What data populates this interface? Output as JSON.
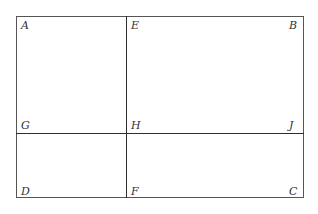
{
  "diagram": {
    "title": "",
    "type": "rectangle-partition",
    "stroke_color": "#3a3a3a",
    "labels": {
      "A": "A",
      "B": "B",
      "C": "C",
      "D": "D",
      "E": "E",
      "F": "F",
      "G": "G",
      "H": "H",
      "J": "J"
    },
    "segments": [
      {
        "from": "A",
        "to": "B",
        "role": "top-side"
      },
      {
        "from": "B",
        "to": "C",
        "role": "right-side"
      },
      {
        "from": "C",
        "to": "D",
        "role": "bottom-side"
      },
      {
        "from": "D",
        "to": "A",
        "role": "left-side"
      },
      {
        "from": "E",
        "to": "F",
        "role": "vertical-divider"
      },
      {
        "from": "G",
        "to": "J",
        "role": "horizontal-divider"
      }
    ],
    "regions": [
      "AEHG",
      "EBJH",
      "GHFD",
      "HJCF"
    ]
  }
}
